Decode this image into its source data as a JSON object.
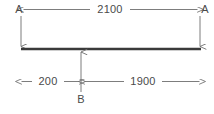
{
  "diagram": {
    "type": "beam-dimension-drawing",
    "title": "",
    "colors": {
      "beam": "#3a3a3a",
      "dimension_line": "#6e6e6e",
      "text": "#4a4a4a",
      "background": "#ffffff"
    },
    "beam": {
      "name": "horizontal-beam",
      "length_label": "2100"
    },
    "nodes": [
      {
        "id": "a-left",
        "label": "A",
        "position": "left-support"
      },
      {
        "id": "a-right",
        "label": "A",
        "position": "right-support"
      },
      {
        "id": "b",
        "label": "B",
        "position": "load-point"
      }
    ],
    "dimensions": [
      {
        "id": "overall-span",
        "value": "2100",
        "placement": "top",
        "from": "A",
        "to": "A",
        "arrows": "both"
      },
      {
        "id": "left-segment",
        "value": "200",
        "placement": "bottom",
        "from": "A",
        "to": "B",
        "arrows": "both"
      },
      {
        "id": "right-segment",
        "value": "1900",
        "placement": "bottom",
        "from": "B",
        "to": "A",
        "arrows": "both"
      }
    ],
    "annotations": {
      "load_arrow_direction": "up",
      "support_arrow_direction": "down"
    }
  }
}
